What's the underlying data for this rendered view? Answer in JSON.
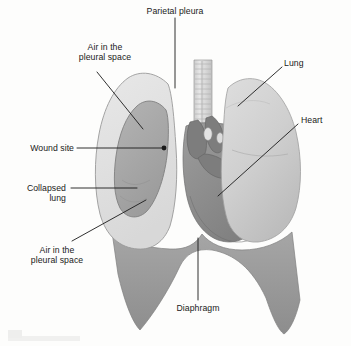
{
  "figure": {
    "name": "pneumothorax-anatomical-diagram",
    "background_color": "#fdfdfc",
    "line_color": "#1a1a1a",
    "text_color": "#1a1a1a"
  },
  "labels": {
    "parietal_pleura": "Parietal pleura",
    "air_pleural_space_top_line1": "Air in the",
    "air_pleural_space_top_line2": "pleural space",
    "wound_site": "Wound site",
    "collapsed_lung_line1": "Collapsed",
    "collapsed_lung_line2": "lung",
    "air_pleural_space_bottom_line1": "Air in the",
    "air_pleural_space_bottom_line2": "pleural space",
    "lung": "Lung",
    "heart": "Heart",
    "diaphragm": "Diaphragm"
  },
  "anatomy": {
    "trachea_color": "#d6d6d6",
    "right_lung_color": "#d2d2d2",
    "collapsed_lung_color": "#a8a8a8",
    "pleura_color": "#e2e2e2",
    "heart_color": "#8e8e8e",
    "diaphragm_color": "#9d9d9d",
    "vessel_color": "#7d7d7d"
  }
}
